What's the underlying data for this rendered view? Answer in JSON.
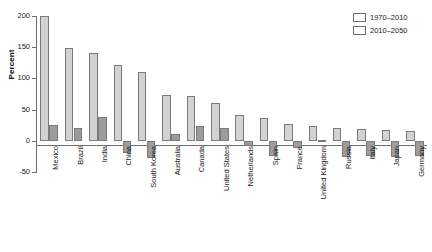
{
  "chart_data": {
    "type": "bar",
    "title": "",
    "xlabel": "",
    "ylabel": "Percent",
    "ylim": [
      -50,
      200
    ],
    "yticks": [
      200,
      150,
      100,
      50,
      0,
      -50
    ],
    "ytick_labels": [
      "200",
      "150",
      "100",
      "50",
      "0",
      "-50"
    ],
    "grid": false,
    "legend_position": "top-right",
    "categories": [
      "Mexico",
      "Brazil",
      "India",
      "China",
      "South Korea",
      "Australia",
      "Canada",
      "United States",
      "Netherlands",
      "Spain",
      "France",
      "United Kingdom",
      "Russia",
      "Italy",
      "Japan",
      "Germany"
    ],
    "series": [
      {
        "name": "1970–2010",
        "color": "#d2d2d2",
        "values": [
          200,
          148,
          141,
          121,
          110,
          74,
          71,
          60,
          41,
          36,
          27,
          23,
          21,
          19,
          18,
          15
        ]
      },
      {
        "name": "2010–2050",
        "color": "#9c9c9c",
        "values": [
          25,
          20,
          38,
          -20,
          -27,
          11,
          23,
          20,
          -8,
          -24,
          -11,
          1,
          -26,
          -24,
          -26,
          -24
        ]
      }
    ]
  },
  "legend": {
    "items": [
      {
        "label": "1970–2010",
        "color": "#d2d2d2"
      },
      {
        "label": "2010–2050",
        "color": "#9c9c9c"
      }
    ]
  },
  "axis": {
    "y_title": "Percent",
    "y_ticks": [
      "200",
      "150",
      "100",
      "50",
      "0",
      "-50"
    ]
  }
}
